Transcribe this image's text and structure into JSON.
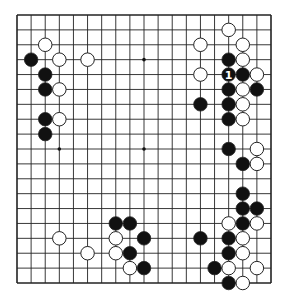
{
  "board": {
    "size": 19,
    "origin": {
      "x": 17,
      "y": 15
    },
    "end": {
      "x": 271,
      "y": 283
    },
    "line_color": "#222222",
    "background": "#ffffff",
    "star_points": [
      [
        3,
        3
      ],
      [
        9,
        3
      ],
      [
        15,
        3
      ],
      [
        3,
        9
      ],
      [
        9,
        9
      ],
      [
        15,
        9
      ],
      [
        3,
        15
      ],
      [
        9,
        15
      ],
      [
        15,
        15
      ]
    ],
    "stones": [
      {
        "color": "white",
        "col": 2,
        "row": 2
      },
      {
        "color": "black",
        "col": 1,
        "row": 3
      },
      {
        "color": "white",
        "col": 3,
        "row": 3
      },
      {
        "color": "white",
        "col": 5,
        "row": 3
      },
      {
        "color": "black",
        "col": 2,
        "row": 4
      },
      {
        "color": "black",
        "col": 2,
        "row": 5
      },
      {
        "color": "white",
        "col": 3,
        "row": 5
      },
      {
        "color": "black",
        "col": 2,
        "row": 7
      },
      {
        "color": "white",
        "col": 3,
        "row": 7
      },
      {
        "color": "black",
        "col": 2,
        "row": 8
      },
      {
        "color": "white",
        "col": 15,
        "row": 1
      },
      {
        "color": "white",
        "col": 13,
        "row": 2
      },
      {
        "color": "white",
        "col": 16,
        "row": 2
      },
      {
        "color": "black",
        "col": 15,
        "row": 3
      },
      {
        "color": "white",
        "col": 16,
        "row": 3
      },
      {
        "color": "white",
        "col": 13,
        "row": 4
      },
      {
        "color": "black",
        "col": 15,
        "row": 4,
        "label": "1"
      },
      {
        "color": "black",
        "col": 16,
        "row": 4
      },
      {
        "color": "white",
        "col": 17,
        "row": 4
      },
      {
        "color": "black",
        "col": 15,
        "row": 5
      },
      {
        "color": "white",
        "col": 16,
        "row": 5
      },
      {
        "color": "black",
        "col": 17,
        "row": 5
      },
      {
        "color": "black",
        "col": 13,
        "row": 6
      },
      {
        "color": "black",
        "col": 15,
        "row": 6
      },
      {
        "color": "white",
        "col": 16,
        "row": 6
      },
      {
        "color": "black",
        "col": 15,
        "row": 7
      },
      {
        "color": "white",
        "col": 16,
        "row": 7
      },
      {
        "color": "black",
        "col": 15,
        "row": 9
      },
      {
        "color": "white",
        "col": 17,
        "row": 9
      },
      {
        "color": "black",
        "col": 16,
        "row": 10
      },
      {
        "color": "white",
        "col": 17,
        "row": 10
      },
      {
        "color": "black",
        "col": 16,
        "row": 12
      },
      {
        "color": "black",
        "col": 16,
        "row": 13
      },
      {
        "color": "black",
        "col": 17,
        "row": 13
      },
      {
        "color": "white",
        "col": 15,
        "row": 14
      },
      {
        "color": "black",
        "col": 16,
        "row": 14
      },
      {
        "color": "white",
        "col": 17,
        "row": 14
      },
      {
        "color": "black",
        "col": 13,
        "row": 15
      },
      {
        "color": "black",
        "col": 15,
        "row": 15
      },
      {
        "color": "white",
        "col": 16,
        "row": 15
      },
      {
        "color": "black",
        "col": 15,
        "row": 16
      },
      {
        "color": "white",
        "col": 16,
        "row": 16
      },
      {
        "color": "black",
        "col": 14,
        "row": 17
      },
      {
        "color": "white",
        "col": 15,
        "row": 17
      },
      {
        "color": "white",
        "col": 17,
        "row": 17
      },
      {
        "color": "black",
        "col": 15,
        "row": 18
      },
      {
        "color": "white",
        "col": 16,
        "row": 18
      },
      {
        "color": "black",
        "col": 7,
        "row": 14
      },
      {
        "color": "black",
        "col": 8,
        "row": 14
      },
      {
        "color": "white",
        "col": 3,
        "row": 15
      },
      {
        "color": "white",
        "col": 7,
        "row": 15
      },
      {
        "color": "black",
        "col": 9,
        "row": 15
      },
      {
        "color": "white",
        "col": 5,
        "row": 16
      },
      {
        "color": "white",
        "col": 7,
        "row": 16
      },
      {
        "color": "black",
        "col": 8,
        "row": 16
      },
      {
        "color": "white",
        "col": 8,
        "row": 17
      },
      {
        "color": "black",
        "col": 9,
        "row": 17
      }
    ]
  }
}
